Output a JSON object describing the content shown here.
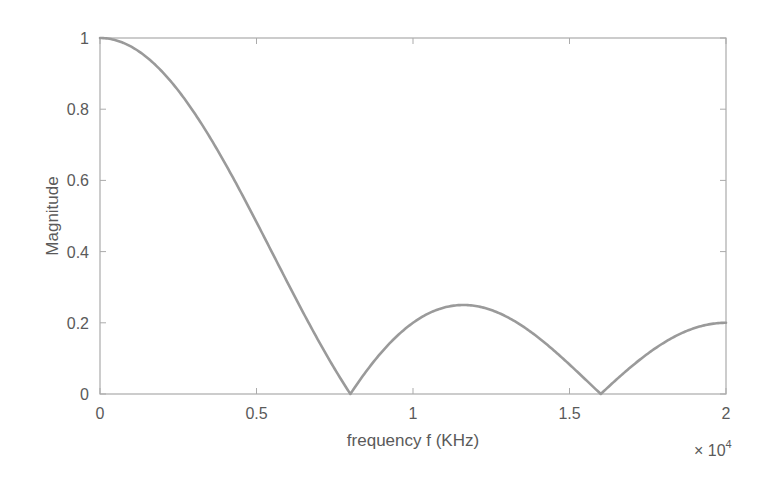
{
  "chart_data": {
    "type": "line",
    "title": "",
    "xlabel": "frequency f (KHz)",
    "ylabel": "Magnitude",
    "x_exponent_label": "× 10",
    "x_exponent_power": "4",
    "xlim": [
      0,
      2
    ],
    "ylim": [
      0,
      1
    ],
    "x_scale_note": "x values in units of 10^4",
    "xticks": [
      0,
      0.5,
      1,
      1.5,
      2
    ],
    "xtick_labels": [
      "0",
      "0.5",
      "1",
      "1.5",
      "2"
    ],
    "yticks": [
      0,
      0.2,
      0.4,
      0.6,
      0.8,
      1
    ],
    "ytick_labels": [
      "0",
      "0.2",
      "0.4",
      "0.6",
      "0.8",
      "1"
    ],
    "grid": false,
    "legend": null,
    "series": [
      {
        "name": "Magnitude response",
        "color": "#9a9a9a",
        "x": [
          0,
          0.1,
          0.2,
          0.3,
          0.4,
          0.5,
          0.6,
          0.7,
          0.8,
          0.9,
          1.0,
          1.1,
          1.2,
          1.3,
          1.4,
          1.5,
          1.6,
          1.7,
          1.8,
          1.9,
          2.0
        ],
        "values": [
          1.0,
          0.975,
          0.904,
          0.794,
          0.655,
          0.497,
          0.335,
          0.172,
          0.0,
          0.103,
          0.183,
          0.233,
          0.247,
          0.229,
          0.182,
          0.112,
          0.0,
          0.071,
          0.131,
          0.175,
          0.2
        ]
      }
    ],
    "notable_points": [
      {
        "label": "first null",
        "x": 0.8,
        "y": 0
      },
      {
        "label": "second lobe peak",
        "x": 1.17,
        "y": 0.25
      },
      {
        "label": "second null",
        "x": 1.6,
        "y": 0
      },
      {
        "label": "value at x=2",
        "x": 2.0,
        "y": 0.2
      }
    ]
  },
  "colors": {
    "curve": "#9a9a9a",
    "axes": "#ababab",
    "text": "#5a5a5a"
  }
}
